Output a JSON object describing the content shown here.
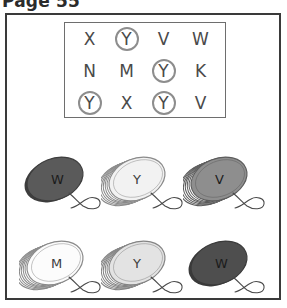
{
  "page": {
    "header": "Page 55",
    "background_color": "#ffffff",
    "frame_color": "#3a3a3a"
  },
  "letter_grid": {
    "border_color": "#6e6e6e",
    "circle_color": "#8d8d8d",
    "letter_color": "#4a4a4a",
    "rows": [
      [
        {
          "letter": "X",
          "circled": false
        },
        {
          "letter": "Y",
          "circled": true
        },
        {
          "letter": "V",
          "circled": false
        },
        {
          "letter": "W",
          "circled": false
        }
      ],
      [
        {
          "letter": "N",
          "circled": false
        },
        {
          "letter": "M",
          "circled": false
        },
        {
          "letter": "Y",
          "circled": true
        },
        {
          "letter": "K",
          "circled": false
        }
      ],
      [
        {
          "letter": "Y",
          "circled": true
        },
        {
          "letter": "X",
          "circled": false
        },
        {
          "letter": "Y",
          "circled": true
        },
        {
          "letter": "V",
          "circled": false
        }
      ]
    ]
  },
  "yoyos": {
    "rows": [
      [
        {
          "letter": "W",
          "face_color": "#5a5a5a",
          "edge_color": "#3d3d3d",
          "style": "solid",
          "letter_shade": "dark"
        },
        {
          "letter": "Y",
          "face_color": "#f2f2f2",
          "edge_color": "#8a8a8a",
          "style": "ridged",
          "letter_shade": "light"
        },
        {
          "letter": "V",
          "face_color": "#8e8e8e",
          "edge_color": "#5c5c5c",
          "style": "ridged",
          "letter_shade": "dark"
        }
      ],
      [
        {
          "letter": "M",
          "face_color": "#fcfcfc",
          "edge_color": "#8a8a8a",
          "style": "ridged",
          "letter_shade": "light"
        },
        {
          "letter": "Y",
          "face_color": "#e3e3e3",
          "edge_color": "#848484",
          "style": "ridged",
          "letter_shade": "light"
        },
        {
          "letter": "W",
          "face_color": "#4e4e4e",
          "edge_color": "#3a3a3a",
          "style": "solid",
          "letter_shade": "dark"
        }
      ]
    ],
    "string_color": "#4a4a4a"
  }
}
